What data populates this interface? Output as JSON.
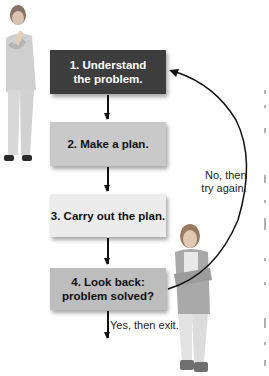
{
  "diagram": {
    "type": "flowchart",
    "steps": [
      {
        "id": 1,
        "line1": "1. Understand",
        "line2": "the problem.",
        "fill": "#3d3d3d",
        "text_color": "#ffffff"
      },
      {
        "id": 2,
        "line1": "2. Make a plan.",
        "line2": "",
        "fill": "#c9c9c9",
        "text_color": "#111111"
      },
      {
        "id": 3,
        "line1": "3. Carry out the plan.",
        "line2": "",
        "fill": "#ececec",
        "text_color": "#111111"
      },
      {
        "id": 4,
        "line1": "4. Look back:",
        "line2": "problem solved?",
        "fill": "#bdbdbd",
        "text_color": "#111111"
      }
    ],
    "loop_label": {
      "line1": "No, then",
      "line2": "try again."
    },
    "exit_label": "Yes, then exit.",
    "figures": [
      "person-thinking-left",
      "person-arms-crossed-right"
    ]
  }
}
